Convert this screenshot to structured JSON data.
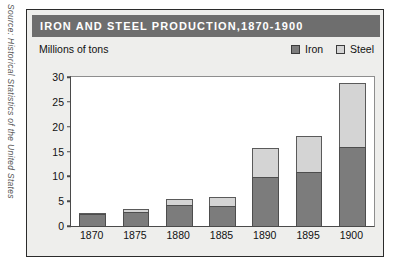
{
  "source_credit": {
    "prefix": "Source:",
    "text": "Historical Statistics of the United States",
    "full": "Source: Historical Statistics of the United States"
  },
  "chart_title": "IRON  AND  STEEL  PRODUCTION,1870-1900",
  "axis_title": "Millions of tons",
  "legend": {
    "position": "top-right",
    "entries": [
      {
        "label": "Iron",
        "color": "#7c7c7c"
      },
      {
        "label": "Steel",
        "color": "#d4d4d4"
      }
    ]
  },
  "colors": {
    "title_bar": "#6e6e6e",
    "title_text": "#ffffff",
    "panel_background": "#eeeeec",
    "plot_background": "#ffffff",
    "frame": "#2b2b2b",
    "iron": "#7c7c7c",
    "steel": "#d4d4d4"
  },
  "chart_data": {
    "type": "bar",
    "title": "IRON  AND  STEEL  PRODUCTION,1870-1900",
    "subtitle": "",
    "xlabel": "",
    "ylabel": "Millions of tons",
    "stacked": true,
    "grid": false,
    "legend_position": "top-right",
    "ylim": [
      0,
      30
    ],
    "yticks": [
      0,
      5,
      10,
      15,
      20,
      25,
      30
    ],
    "ytick_labels": [
      "0",
      "5",
      "10",
      "15",
      "20",
      "25",
      "30"
    ],
    "categories": [
      "1870",
      "1875",
      "1880",
      "1885",
      "1890",
      "1895",
      "1900"
    ],
    "series": [
      {
        "name": "Iron",
        "color": "#7c7c7c",
        "values": [
          2.4,
          2.8,
          4.2,
          4.1,
          9.9,
          10.9,
          15.9
        ]
      },
      {
        "name": "Steel",
        "color": "#d4d4d4",
        "values": [
          0.1,
          0.6,
          1.2,
          1.7,
          5.8,
          7.3,
          12.8
        ]
      }
    ],
    "totals": [
      2.5,
      3.4,
      5.4,
      5.8,
      15.7,
      18.2,
      28.7
    ]
  }
}
